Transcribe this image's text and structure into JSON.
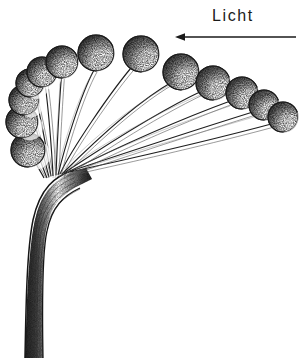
{
  "figure": {
    "type": "scientific-line-drawing",
    "background_color": "#ffffff",
    "ink_color": "#1a1a1a"
  },
  "annotation": {
    "light_label": "Licht",
    "arrow": {
      "name": "light-direction-arrow",
      "direction": "left",
      "x_start": 296,
      "x_end": 175,
      "y": 37,
      "color": "#1a1a1a",
      "stroke_width": 1.6,
      "head_length": 9,
      "head_width": 7
    },
    "label_position": {
      "x": 212,
      "y": 6
    },
    "label_font_size": 16,
    "label_letter_spacing": 1.6
  },
  "drawing": {
    "stem_bundle": {
      "name": "stem-bundle-trunk",
      "base_center_x": 37,
      "base_bottom_y": 358,
      "base_width": 24,
      "curve_apex_y": 190,
      "fan_origin": {
        "x": 46,
        "y": 175
      },
      "color": "#222222"
    },
    "sphere_style": {
      "outline_color": "#1b1b1b",
      "outline_width": 1.1,
      "shadow_color": "#3a3a3a",
      "highlight_color": "#ffffff",
      "stipple_color": "#2a2a2a",
      "light_from": "lower-right"
    },
    "spheres": [
      {
        "name": "head-01",
        "cx": 28,
        "cy": 150,
        "r": 17,
        "stem_end_x": 44,
        "stem_end_y": 178
      },
      {
        "name": "head-02",
        "cx": 22,
        "cy": 122,
        "r": 16,
        "stem_end_x": 45,
        "stem_end_y": 177
      },
      {
        "name": "head-03",
        "cx": 24,
        "cy": 100,
        "r": 15,
        "stem_end_x": 46,
        "stem_end_y": 176
      },
      {
        "name": "head-04",
        "cx": 30,
        "cy": 83,
        "r": 14,
        "stem_end_x": 47,
        "stem_end_y": 176
      },
      {
        "name": "head-05",
        "cx": 42,
        "cy": 72,
        "r": 15,
        "stem_end_x": 48,
        "stem_end_y": 175
      },
      {
        "name": "head-06",
        "cx": 62,
        "cy": 62,
        "r": 16,
        "stem_end_x": 49,
        "stem_end_y": 175
      },
      {
        "name": "head-07",
        "cx": 96,
        "cy": 53,
        "r": 18,
        "stem_end_x": 50,
        "stem_end_y": 174
      },
      {
        "name": "head-08",
        "cx": 141,
        "cy": 54,
        "r": 18,
        "stem_end_x": 51,
        "stem_end_y": 174
      },
      {
        "name": "head-09",
        "cx": 181,
        "cy": 72,
        "r": 18,
        "stem_end_x": 52,
        "stem_end_y": 173
      },
      {
        "name": "head-10",
        "cx": 213,
        "cy": 83,
        "r": 17,
        "stem_end_x": 53,
        "stem_end_y": 173
      },
      {
        "name": "head-11",
        "cx": 242,
        "cy": 93,
        "r": 16,
        "stem_end_x": 54,
        "stem_end_y": 172
      },
      {
        "name": "head-12",
        "cx": 264,
        "cy": 105,
        "r": 15,
        "stem_end_x": 55,
        "stem_end_y": 172
      },
      {
        "name": "head-13",
        "cx": 283,
        "cy": 117,
        "r": 15,
        "stem_end_x": 56,
        "stem_end_y": 171
      }
    ],
    "stem_count": 13
  }
}
